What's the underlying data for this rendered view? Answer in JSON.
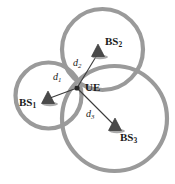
{
  "figure": {
    "type": "network-topology-diagram",
    "canvas": {
      "width": 175,
      "height": 184
    },
    "background_color": "#ffffff",
    "ring_color": "#9a9a9a",
    "marker_color": "#4a4a4a",
    "line_color": "#3a3a3a"
  },
  "cells": [
    {
      "id": "cell-1",
      "owner": "BS1",
      "cx": 48.5,
      "cy": 95.5,
      "r": 33.0
    },
    {
      "id": "cell-2",
      "owner": "BS2",
      "cx": 102.5,
      "cy": 49.5,
      "r": 40.5
    },
    {
      "id": "cell-3",
      "owner": "BS3",
      "cx": 114.5,
      "cy": 118.5,
      "r": 52.5
    }
  ],
  "nodes": {
    "ue": {
      "label": "UE",
      "x": 77.0,
      "y": 88.0,
      "label_x": 85,
      "label_y": 83
    },
    "base_stations": [
      {
        "id": "BS1",
        "label": "BS",
        "subscript": "1",
        "x": 48.0,
        "y": 99.0,
        "label_x": 19,
        "label_y": 103
      },
      {
        "id": "BS2",
        "label": "BS",
        "subscript": "2",
        "x": 98.0,
        "y": 52.0,
        "label_x": 105,
        "label_y": 42
      },
      {
        "id": "BS3",
        "label": "BS",
        "subscript": "3",
        "x": 115.0,
        "y": 126.0,
        "label_x": 120,
        "label_y": 138
      }
    ]
  },
  "distances": [
    {
      "id": "d1",
      "label": "d",
      "subscript": "1",
      "from": "BS1",
      "to": "UE",
      "label_x": 53,
      "label_y": 76
    },
    {
      "id": "d2",
      "label": "d",
      "subscript": "2",
      "from": "BS2",
      "to": "UE",
      "label_x": 73,
      "label_y": 62
    },
    {
      "id": "d3",
      "label": "d",
      "subscript": "3",
      "from": "BS3",
      "to": "UE",
      "label_x": 86,
      "label_y": 113
    }
  ]
}
